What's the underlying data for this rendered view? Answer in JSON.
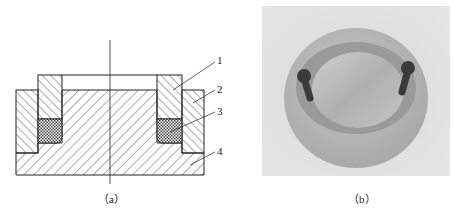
{
  "figure": {
    "panel_a": {
      "caption": "（a）",
      "labels": [
        "1",
        "2",
        "3",
        "4"
      ]
    },
    "panel_b": {
      "caption": "（b）"
    }
  },
  "colors": {
    "line": "#222222",
    "photo_bg": "#dcdcdc",
    "metal": "#b8b8b8"
  }
}
